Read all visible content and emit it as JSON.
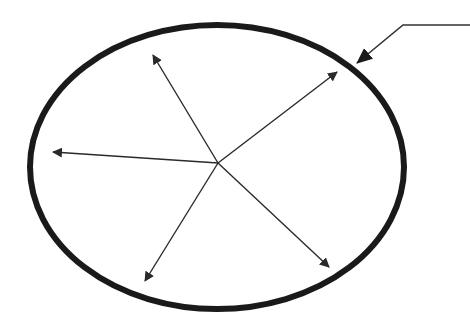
{
  "diagram": {
    "type": "ellipse-with-radial-arrows",
    "colors": {
      "background": "#ffffff",
      "stroke": "#1a1a1a",
      "arrow": "#2a2a2a"
    },
    "ellipse": {
      "cx": 217,
      "cy": 167,
      "rx": 187,
      "ry": 142,
      "stroke_width": 6
    },
    "center": {
      "x": 218,
      "y": 163
    },
    "radial_arrows": [
      {
        "id": "upper-left",
        "tip": {
          "x": 153,
          "y": 55
        }
      },
      {
        "id": "upper-right",
        "tip": {
          "x": 337,
          "y": 72
        }
      },
      {
        "id": "left",
        "tip": {
          "x": 53,
          "y": 152
        }
      },
      {
        "id": "lower-left",
        "tip": {
          "x": 145,
          "y": 281
        }
      },
      {
        "id": "lower-right",
        "tip": {
          "x": 329,
          "y": 267
        }
      }
    ],
    "pointer_arrow": {
      "label": "",
      "start": {
        "x": 470,
        "y": 25
      },
      "bend": {
        "x": 403,
        "y": 25
      },
      "tip": {
        "x": 357,
        "y": 63
      }
    }
  }
}
